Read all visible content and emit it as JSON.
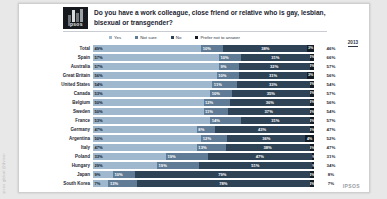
{
  "edge": {
    "watermark": "ipsos global @dvisor"
  },
  "brand": {
    "logo_text": "Ipsos",
    "footer_mark": "IPSOS"
  },
  "header": {
    "title": "Do you have a work colleague, close friend or relative who is gay, lesbian, bisexual or transgender?"
  },
  "legend": [
    {
      "label": "Yes",
      "color": "#9fb8cd"
    },
    {
      "label": "Not sure",
      "color": "#5f7b95"
    },
    {
      "label": "No",
      "color": "#2e4356"
    },
    {
      "label": "Prefer not to answer",
      "color": "#121b24"
    }
  ],
  "chart_data": {
    "type": "bar",
    "subtype": "stacked-horizontal-100",
    "title": "Do you have a work colleague, close friend or relative who is gay, lesbian, bisexual or transgender?",
    "xlabel": "",
    "ylabel": "",
    "xlim": [
      0,
      100
    ],
    "grid": false,
    "legend_position": "top",
    "prev_column_header": "2013",
    "categories": [
      "Total",
      "Spain",
      "Australia",
      "Great Britain",
      "United States",
      "Canada",
      "Belgium",
      "Sweden",
      "France",
      "Germany",
      "Argentina",
      "Italy",
      "Poland",
      "Hungary",
      "Japan",
      "South Korea"
    ],
    "series": [
      {
        "name": "Yes",
        "color": "#9fb8cd",
        "values": [
          49,
          57,
          57,
          56,
          54,
          53,
          50,
          50,
          53,
          47,
          50,
          47,
          33,
          29,
          9,
          7
        ]
      },
      {
        "name": "Not sure",
        "color": "#5f7b95",
        "values": [
          10,
          10,
          9,
          10,
          11,
          10,
          12,
          11,
          14,
          8,
          12,
          13,
          19,
          19,
          10,
          13
        ]
      },
      {
        "name": "No",
        "color": "#2e4356",
        "values": [
          38,
          31,
          32,
          31,
          33,
          35,
          36,
          37,
          31,
          43,
          36,
          38,
          47,
          51,
          79,
          78
        ]
      },
      {
        "name": "Prefer not to answer",
        "color": "#121b24",
        "values": [
          3,
          2,
          2,
          3,
          2,
          2,
          2,
          2,
          2,
          2,
          2,
          2,
          1,
          1,
          2,
          2
        ]
      }
    ],
    "rows": [
      {
        "country": "Total",
        "yes": 49,
        "not_sure": 10,
        "no": 38,
        "prefer": 3,
        "prev_2013": 46,
        "labels": {
          "yes": "49%",
          "not_sure": "10%",
          "no": "38%",
          "prefer": "3%",
          "prev": "46%"
        }
      },
      {
        "country": "Spain",
        "yes": 57,
        "not_sure": 10,
        "no": 31,
        "prefer": 2,
        "prev_2013": 66,
        "labels": {
          "yes": "57%",
          "not_sure": "10%",
          "no": "31%",
          "prefer": "2%",
          "prev": "66%"
        }
      },
      {
        "country": "Australia",
        "yes": 57,
        "not_sure": 9,
        "no": 32,
        "prefer": 2,
        "prev_2013": 57,
        "labels": {
          "yes": "57%",
          "not_sure": "9%",
          "no": "32%",
          "prefer": "2%",
          "prev": "57%"
        }
      },
      {
        "country": "Great Britain",
        "yes": 56,
        "not_sure": 10,
        "no": 31,
        "prefer": 3,
        "prev_2013": 56,
        "labels": {
          "yes": "56%",
          "not_sure": "10%",
          "no": "31%",
          "prefer": "3%",
          "prev": "56%"
        }
      },
      {
        "country": "United States",
        "yes": 54,
        "not_sure": 11,
        "no": 33,
        "prefer": 2,
        "prev_2013": 54,
        "labels": {
          "yes": "54%",
          "not_sure": "11%",
          "no": "33%",
          "prefer": "2%",
          "prev": "54%"
        }
      },
      {
        "country": "Canada",
        "yes": 53,
        "not_sure": 10,
        "no": 35,
        "prefer": 2,
        "prev_2013": 57,
        "labels": {
          "yes": "53%",
          "not_sure": "10%",
          "no": "35%",
          "prefer": "2%",
          "prev": "57%"
        }
      },
      {
        "country": "Belgium",
        "yes": 50,
        "not_sure": 12,
        "no": 36,
        "prefer": 2,
        "prev_2013": 56,
        "labels": {
          "yes": "50%",
          "not_sure": "12%",
          "no": "36%",
          "prefer": "2%",
          "prev": "56%"
        }
      },
      {
        "country": "Sweden",
        "yes": 50,
        "not_sure": 11,
        "no": 37,
        "prefer": 2,
        "prev_2013": 54,
        "labels": {
          "yes": "50%",
          "not_sure": "11%",
          "no": "37%",
          "prefer": "2%",
          "prev": "54%"
        }
      },
      {
        "country": "France",
        "yes": 53,
        "not_sure": 14,
        "no": 31,
        "prefer": 2,
        "prev_2013": 57,
        "labels": {
          "yes": "53%",
          "not_sure": "14%",
          "no": "31%",
          "prefer": "2%",
          "prev": "57%"
        }
      },
      {
        "country": "Germany",
        "yes": 47,
        "not_sure": 8,
        "no": 43,
        "prefer": 2,
        "prev_2013": 47,
        "labels": {
          "yes": "47%",
          "not_sure": "8%",
          "no": "43%",
          "prefer": "2%",
          "prev": "47%"
        }
      },
      {
        "country": "Argentina",
        "yes": 50,
        "not_sure": 12,
        "no": 36,
        "prefer": 4,
        "prev_2013": 52,
        "labels": {
          "yes": "50%",
          "not_sure": "12%",
          "no": "36%",
          "prefer": "4%",
          "prev": "52%"
        }
      },
      {
        "country": "Italy",
        "yes": 47,
        "not_sure": 13,
        "no": 38,
        "prefer": 2,
        "prev_2013": 47,
        "labels": {
          "yes": "47%",
          "not_sure": "13%",
          "no": "38%",
          "prefer": "2%",
          "prev": "47%"
        }
      },
      {
        "country": "Poland",
        "yes": 33,
        "not_sure": 19,
        "no": 47,
        "prefer": 1,
        "prev_2013": 31,
        "labels": {
          "yes": "33%",
          "not_sure": "19%",
          "no": "47%",
          "prefer": "1%",
          "prev": "31%"
        }
      },
      {
        "country": "Hungary",
        "yes": 29,
        "not_sure": 19,
        "no": 51,
        "prefer": 1,
        "prev_2013": 34,
        "labels": {
          "yes": "29%",
          "not_sure": "19%",
          "no": "51%",
          "prefer": "1%",
          "prev": "34%"
        }
      },
      {
        "country": "Japan",
        "yes": 9,
        "not_sure": 10,
        "no": 79,
        "prefer": 2,
        "prev_2013": 8,
        "labels": {
          "yes": "9%",
          "not_sure": "10%",
          "no": "79%",
          "prefer": "2%",
          "prev": "8%"
        }
      },
      {
        "country": "South Korea",
        "yes": 7,
        "not_sure": 13,
        "no": 78,
        "prefer": 2,
        "prev_2013": 7,
        "labels": {
          "yes": "7%",
          "not_sure": "13%",
          "no": "78%",
          "prefer": "2%",
          "prev": "7%"
        }
      }
    ]
  }
}
